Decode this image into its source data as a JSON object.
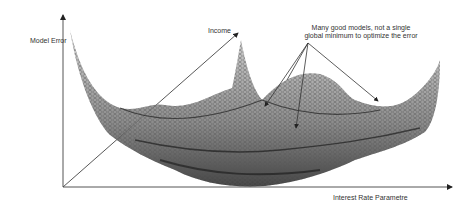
{
  "figure": {
    "type": "3d error surface diagram",
    "axes": {
      "vertical_label": "Model Error",
      "diagonal_label": "Income",
      "horizontal_label": "Interest Rate Parametre"
    },
    "annotation": {
      "line1": "Many good models,  not a single",
      "line2": "global minimum to optimize the error",
      "arrow_count": 4
    },
    "colors": {
      "axis": "#555555",
      "surface_dark": "#2a2a2a",
      "surface_light": "#bbbbbb",
      "text": "#333333"
    }
  }
}
